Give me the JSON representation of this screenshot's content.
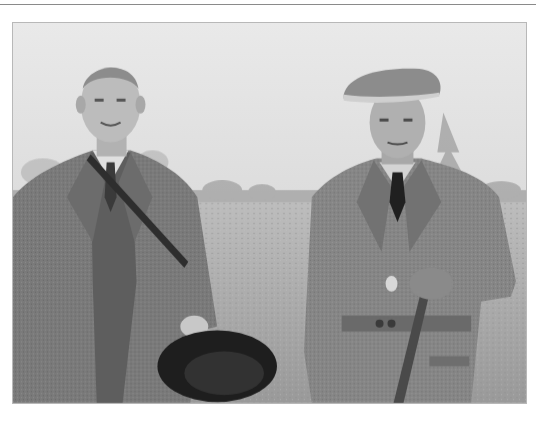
{
  "image": {
    "type": "photograph",
    "style": "black-and-white vintage",
    "description": "Two men standing outdoors in a grassy field; left man bare-headed in tweed three-piece suit holding a dark felt hat; right man in flat tweed cap and belted tweed coat holding a walking stick",
    "subjects": [
      {
        "position": "left",
        "clothing": "tweed jacket, waistcoat, shirt and tie, shoulder strap",
        "holding": "dark felt hat"
      },
      {
        "position": "right",
        "clothing": "flat tweed cap, belted tweed shooting coat, dark tie",
        "holding": "walking stick"
      }
    ],
    "setting": "open field with distant tree line under overcast sky"
  },
  "colors": {
    "sky": "#e4e4e4",
    "field": "#a9a9a9",
    "treeline": "#9c9c9c",
    "tweed_left": "#7a7a7a",
    "tweed_right": "#858585",
    "dark": "#262626",
    "rule": "#8a8a8a"
  }
}
